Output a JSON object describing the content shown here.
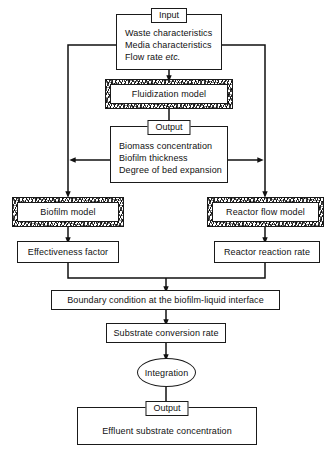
{
  "diagram": {
    "background": "#ffffff",
    "line_color": "#111111"
  },
  "nodes": {
    "input": {
      "caption": "Input",
      "lines": [
        "Waste characteristics",
        "Media characteristics",
        "Flow rate "
      ],
      "line3_italic": "etc.",
      "shape": "rect"
    },
    "fluidization_model": {
      "label": "Fluidization model",
      "shape": "hatched-rect"
    },
    "output_mid": {
      "caption": "Output",
      "lines": [
        "Biomass concentration",
        "Biofilm thickness",
        "Degree of bed expansion"
      ],
      "shape": "rect"
    },
    "biofilm_model": {
      "label": "Biofilm model",
      "shape": "hatched-rect"
    },
    "reactor_flow_model": {
      "label": "Reactor flow model",
      "shape": "hatched-rect"
    },
    "effectiveness_factor": {
      "label": "Effectiveness factor",
      "shape": "rect"
    },
    "reactor_reaction_rate": {
      "label": "Reactor reaction rate",
      "shape": "rect"
    },
    "boundary_condition": {
      "label": "Boundary condition at the biofilm-liquid interface",
      "shape": "rect"
    },
    "substrate_conversion_rate": {
      "label": "Substrate conversion rate",
      "shape": "rect"
    },
    "integration": {
      "label": "Integration",
      "shape": "ellipse"
    },
    "output_final": {
      "caption": "Output",
      "lines": [
        "Effluent substrate concentration"
      ],
      "shape": "rect"
    }
  },
  "edges": [
    {
      "from": "input",
      "to": "fluidization_model",
      "style": "arrow-down"
    },
    {
      "from": "input",
      "to": "biofilm_model",
      "style": "left-bus-arrow-down"
    },
    {
      "from": "input",
      "to": "reactor_flow_model",
      "style": "right-bus-arrow-down"
    },
    {
      "from": "fluidization_model",
      "to": "output_mid",
      "style": "arrow-down"
    },
    {
      "from": "output_mid",
      "to": "left-bus",
      "style": "arrow-left"
    },
    {
      "from": "output_mid",
      "to": "right-bus",
      "style": "arrow-right"
    },
    {
      "from": "biofilm_model",
      "to": "effectiveness_factor",
      "style": "arrow-down"
    },
    {
      "from": "reactor_flow_model",
      "to": "reactor_reaction_rate",
      "style": "arrow-down"
    },
    {
      "from": "effectiveness_factor",
      "to": "boundary_condition",
      "style": "merge-arrow-down"
    },
    {
      "from": "reactor_reaction_rate",
      "to": "boundary_condition",
      "style": "merge-arrow-down"
    },
    {
      "from": "boundary_condition",
      "to": "substrate_conversion_rate",
      "style": "arrow-down"
    },
    {
      "from": "substrate_conversion_rate",
      "to": "integration",
      "style": "arrow-down"
    },
    {
      "from": "integration",
      "to": "output_final",
      "style": "arrow-down"
    }
  ]
}
